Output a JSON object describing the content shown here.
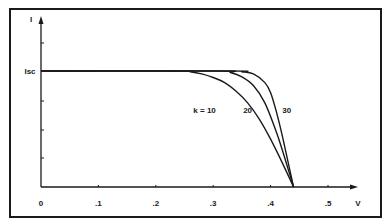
{
  "chart_data": {
    "type": "line",
    "title": "",
    "xlabel": "V",
    "ylabel": "I",
    "x_ticks": [
      "0",
      ".1",
      ".2",
      ".3",
      ".4",
      ".5"
    ],
    "x_tick_values": [
      0,
      0.1,
      0.2,
      0.3,
      0.4,
      0.5
    ],
    "xlim": [
      0,
      0.53
    ],
    "y_tick_labels": [
      "Isc"
    ],
    "isc_level": 0.8,
    "ylim": [
      0,
      1.0
    ],
    "y_ticks_count": 5,
    "grid": false,
    "legend": "inline labels",
    "voc": 0.44,
    "series": [
      {
        "name": "k = 10",
        "k": 10,
        "label_pos": [
          0.285,
          0.53
        ],
        "x": [
          0,
          0.24,
          0.26,
          0.28,
          0.3,
          0.32,
          0.34,
          0.36,
          0.38,
          0.4,
          0.42,
          0.44
        ],
        "y": [
          0.8,
          0.8,
          0.795,
          0.78,
          0.755,
          0.72,
          0.66,
          0.58,
          0.47,
          0.33,
          0.17,
          0.0
        ]
      },
      {
        "name": "20",
        "k": 20,
        "label_pos": [
          0.36,
          0.53
        ],
        "x": [
          0,
          0.31,
          0.33,
          0.35,
          0.37,
          0.39,
          0.41,
          0.42,
          0.43,
          0.44
        ],
        "y": [
          0.8,
          0.8,
          0.79,
          0.76,
          0.7,
          0.58,
          0.38,
          0.26,
          0.13,
          0.0
        ]
      },
      {
        "name": "30",
        "k": 30,
        "label_pos": [
          0.428,
          0.53
        ],
        "x": [
          0,
          0.33,
          0.35,
          0.37,
          0.39,
          0.4,
          0.41,
          0.42,
          0.43,
          0.44
        ],
        "y": [
          0.8,
          0.8,
          0.795,
          0.78,
          0.72,
          0.65,
          0.52,
          0.36,
          0.18,
          0.0
        ]
      }
    ]
  }
}
